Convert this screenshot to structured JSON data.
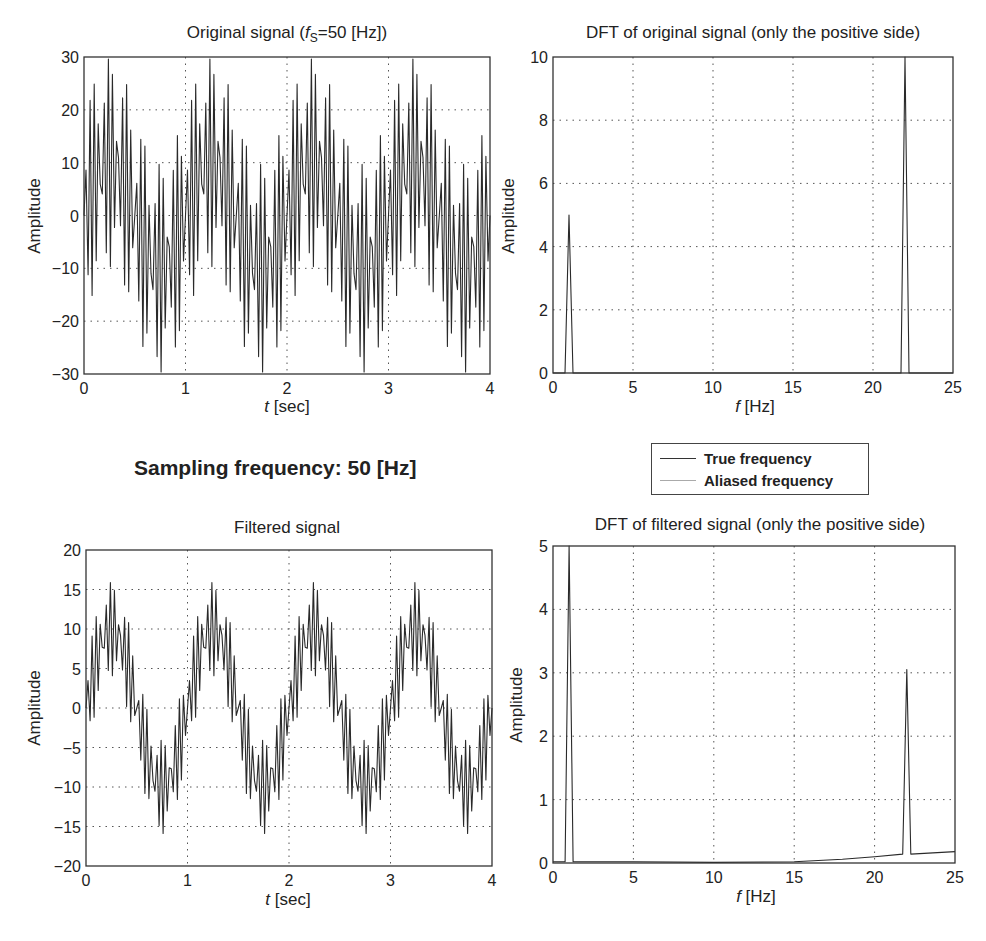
{
  "suptitle": "Sampling frequency: 50 [Hz]",
  "legend": {
    "items": [
      {
        "label": "True frequency",
        "color": "#333333"
      },
      {
        "label": "Aliased frequency",
        "color": "#aaaaaa"
      }
    ]
  },
  "chart_data": [
    {
      "id": "original",
      "type": "line",
      "title_prefix": "Original signal (",
      "title_italic": "f",
      "title_sub": "S",
      "title_suffix": "=50 [Hz])",
      "xlabel_italic": "t",
      "xlabel_rest": " [sec]",
      "ylabel": "Amplitude",
      "xlim": [
        0,
        4
      ],
      "ylim": [
        -30,
        30
      ],
      "xticks": [
        0,
        1,
        2,
        3,
        4
      ],
      "yticks": [
        -30,
        -20,
        -10,
        0,
        10,
        20,
        30
      ],
      "ytick_labels": [
        "−30",
        "−20",
        "−10",
        "0",
        "10",
        "20",
        "30"
      ],
      "grid": true,
      "frame": {
        "x0": 84,
        "y0": 57,
        "x1": 490,
        "y1": 374
      },
      "signal": {
        "fs": 50,
        "components": [
          {
            "freq": 1,
            "amp": 10
          },
          {
            "freq": 22,
            "amp": 20
          }
        ]
      }
    },
    {
      "id": "dft_original",
      "type": "line",
      "title": "DFT of  original  signal (only the positive side)",
      "xlabel_italic": "f",
      "xlabel_rest": " [Hz]",
      "ylabel": "Amplitude",
      "xlim": [
        0,
        25
      ],
      "ylim": [
        0,
        10
      ],
      "xticks": [
        0,
        5,
        10,
        15,
        20,
        25
      ],
      "yticks": [
        0,
        2,
        4,
        6,
        8,
        10
      ],
      "ytick_labels": [
        "0",
        "2",
        "4",
        "6",
        "8",
        "10"
      ],
      "grid": true,
      "frame": {
        "x0": 553,
        "y0": 57,
        "x1": 953,
        "y1": 373
      },
      "x": [
        0,
        0.75,
        1.0,
        1.25,
        21.75,
        22.0,
        22.25,
        25
      ],
      "y": [
        0,
        0,
        5,
        0,
        0,
        10,
        0,
        0
      ],
      "peaks": [
        {
          "f": 1,
          "amplitude": 5
        },
        {
          "f": 22,
          "amplitude": 10
        }
      ]
    },
    {
      "id": "filtered",
      "type": "line",
      "title": "Filtered  signal",
      "xlabel_italic": "t",
      "xlabel_rest": " [sec]",
      "ylabel": "Amplitude",
      "xlim": [
        0,
        4
      ],
      "ylim": [
        -20,
        20
      ],
      "xticks": [
        0,
        1,
        2,
        3,
        4
      ],
      "yticks": [
        -20,
        -15,
        -10,
        -5,
        0,
        5,
        10,
        15,
        20
      ],
      "ytick_labels": [
        "−20",
        "−15",
        "−10",
        "−5",
        "0",
        "5",
        "10",
        "15",
        "20"
      ],
      "grid": true,
      "frame": {
        "x0": 86,
        "y0": 550,
        "x1": 492,
        "y1": 866
      },
      "signal": {
        "fs": 50,
        "components": [
          {
            "freq": 1,
            "amp": 10
          },
          {
            "freq": 22,
            "amp": 6
          }
        ]
      }
    },
    {
      "id": "dft_filtered",
      "type": "line",
      "title": "DFT of  filtered  signal (only the positive side)",
      "xlabel_italic": "f",
      "xlabel_rest": " [Hz]",
      "ylabel": "Amplitude",
      "xlim": [
        0,
        25
      ],
      "ylim": [
        0,
        5
      ],
      "xticks": [
        0,
        5,
        10,
        15,
        20,
        25
      ],
      "yticks": [
        0,
        1,
        2,
        3,
        4,
        5
      ],
      "ytick_labels": [
        "0",
        "1",
        "2",
        "3",
        "4",
        "5"
      ],
      "grid": true,
      "frame": {
        "x0": 553,
        "y0": 546,
        "x1": 955,
        "y1": 863
      },
      "x": [
        0,
        0.75,
        1.0,
        1.25,
        5,
        10,
        15,
        18,
        20,
        21.75,
        22.0,
        22.25,
        25
      ],
      "y": [
        0.02,
        0.02,
        5,
        0.02,
        0.02,
        0.01,
        0.02,
        0.06,
        0.1,
        0.14,
        3.05,
        0.14,
        0.18
      ],
      "peaks": [
        {
          "f": 1,
          "amplitude": 5
        },
        {
          "f": 22,
          "amplitude": 3.05
        }
      ]
    }
  ]
}
